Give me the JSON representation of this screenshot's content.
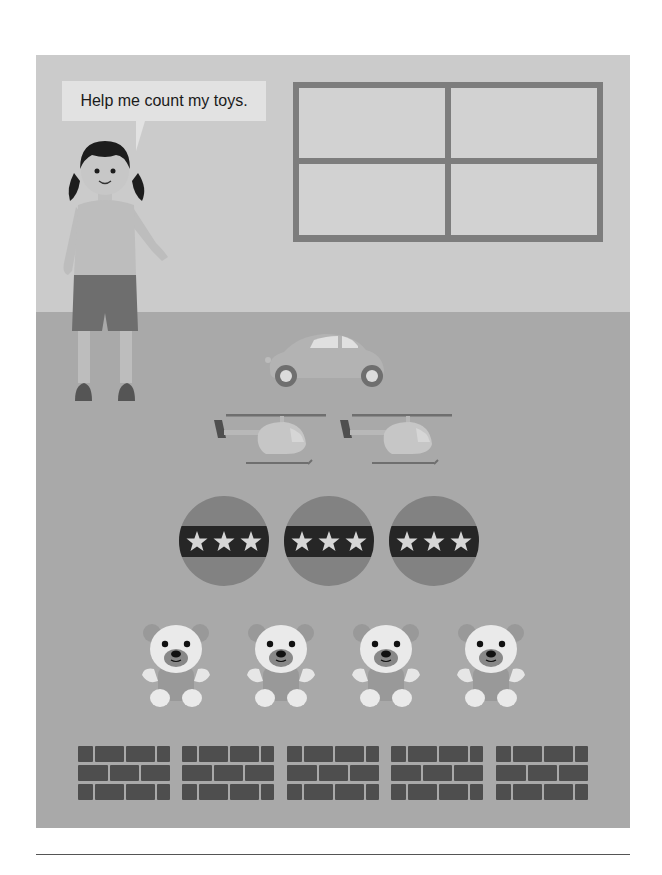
{
  "speech_bubble": {
    "text": "Help me count my toys."
  },
  "scene": {
    "background_wall": "#cbcbcb",
    "background_floor": "#a9a9a9",
    "window": {
      "panes": 4,
      "frame_color": "#7d7d7d",
      "pane_color": "#d2d2d2"
    },
    "character": "girl-with-pigtails"
  },
  "toys": [
    {
      "type": "car",
      "count": 1,
      "icon": "car-icon"
    },
    {
      "type": "helicopter",
      "count": 2,
      "icon": "helicopter-icon"
    },
    {
      "type": "ball",
      "count": 3,
      "icon": "ball-icon",
      "stars_per_ball": 3
    },
    {
      "type": "teddy-bear",
      "count": 4,
      "icon": "teddy-bear-icon"
    },
    {
      "type": "brick-block",
      "count": 5,
      "icon": "brick-block-icon"
    }
  ]
}
